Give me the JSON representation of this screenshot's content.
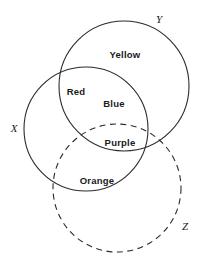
{
  "diagram": {
    "type": "venn-diagram",
    "title": "",
    "stroke_color": "#2b2b2b",
    "background_color": "#ffffff",
    "sets": [
      {
        "id": "X",
        "label": "X",
        "style": "solid",
        "cx": 86,
        "cy": 129,
        "r": 62,
        "label_x": 14,
        "label_y": 128
      },
      {
        "id": "Y",
        "label": "Y",
        "style": "solid",
        "cx": 124,
        "cy": 86,
        "r": 65,
        "label_x": 159,
        "label_y": 19
      },
      {
        "id": "Z",
        "label": "Z",
        "style": "dashed",
        "cx": 117,
        "cy": 188,
        "r": 64,
        "label_x": 185,
        "label_y": 226
      }
    ],
    "regions": [
      {
        "id": "yellow",
        "label": "Yellow",
        "x": 125,
        "y": 54,
        "sets": "Y"
      },
      {
        "id": "red",
        "label": "Red",
        "x": 76,
        "y": 91,
        "sets": "X,Y"
      },
      {
        "id": "blue",
        "label": "Blue",
        "x": 114,
        "y": 103,
        "sets": "Y"
      },
      {
        "id": "purple",
        "label": "Purple",
        "x": 120,
        "y": 142,
        "sets": "X,Y,Z"
      },
      {
        "id": "orange",
        "label": "Orange",
        "x": 97,
        "y": 180,
        "sets": "X,Z"
      }
    ]
  }
}
